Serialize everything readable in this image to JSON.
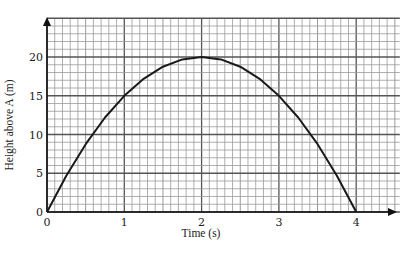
{
  "chart_data": {
    "type": "line",
    "title": "",
    "xlabel": "Time (s)",
    "ylabel": "Height above A (m)",
    "xlim": [
      0,
      4.5
    ],
    "ylim": [
      0,
      25
    ],
    "x_ticks": [
      0,
      1,
      2,
      3,
      4
    ],
    "x_tick_labels": [
      "0",
      "1",
      "2",
      "3",
      "4"
    ],
    "y_ticks": [
      0,
      5,
      10,
      15,
      20
    ],
    "y_tick_labels": [
      "0",
      "5",
      "10",
      "15",
      "20"
    ],
    "grid": true,
    "grid_minor_x_step": 0.1,
    "grid_minor_y_step": 1,
    "legend": null,
    "series": [
      {
        "name": "height",
        "x": [
          0,
          0.25,
          0.5,
          0.75,
          1,
          1.25,
          1.5,
          1.75,
          2,
          2.25,
          2.5,
          2.75,
          3,
          3.25,
          3.5,
          3.75,
          4
        ],
        "y": [
          0,
          4.69,
          8.75,
          12.19,
          15,
          17.19,
          18.75,
          19.69,
          20,
          19.69,
          18.75,
          17.19,
          15,
          12.19,
          8.75,
          4.69,
          0
        ]
      }
    ],
    "colors": {
      "curve": "#1a1a1a",
      "grid_minor": "#9a9a9a",
      "grid_major": "#555555",
      "axis": "#111111"
    }
  }
}
